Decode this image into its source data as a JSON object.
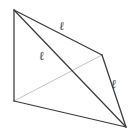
{
  "figure": {
    "name": "tetrahedron-edge-length-diagram",
    "background_color": "#ffffff",
    "solid_edge_color": "#3a3a3e",
    "hidden_edge_color": "#c2c2c6",
    "vertices": [
      {
        "id": "A",
        "x": 14,
        "y": 10
      },
      {
        "id": "B",
        "x": 14,
        "y": 101
      },
      {
        "id": "C",
        "x": 102,
        "y": 55
      },
      {
        "id": "D",
        "x": 126,
        "y": 127
      }
    ],
    "edges": [
      {
        "id": "AB",
        "from": "A",
        "to": "B",
        "style": "solid",
        "label": ""
      },
      {
        "id": "AC",
        "from": "A",
        "to": "C",
        "style": "solid",
        "label": "ℓ"
      },
      {
        "id": "AD",
        "from": "A",
        "to": "D",
        "style": "solid",
        "label": "ℓ"
      },
      {
        "id": "BC",
        "from": "B",
        "to": "C",
        "style": "hidden",
        "label": ""
      },
      {
        "id": "BD",
        "from": "B",
        "to": "D",
        "style": "solid",
        "label": ""
      },
      {
        "id": "CD",
        "from": "C",
        "to": "D",
        "style": "solid",
        "label": "ℓ"
      }
    ],
    "labels": {
      "top": "ℓ",
      "middle": "ℓ",
      "right": "ℓ"
    }
  }
}
